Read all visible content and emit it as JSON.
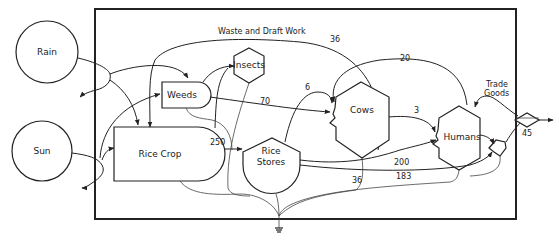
{
  "diagram": {
    "type": "energy-systems-flow-diagram",
    "sources": [
      {
        "id": "rain",
        "label": "Rain",
        "icon": "circle-source-icon"
      },
      {
        "id": "sun",
        "label": "Sun",
        "icon": "circle-source-icon"
      }
    ],
    "nodes": [
      {
        "id": "weeds",
        "label": "Weeds",
        "shape": "producer"
      },
      {
        "id": "insects",
        "label": "Insects",
        "shape": "consumer-hexagon"
      },
      {
        "id": "rice_crop",
        "label": "Rice Crop",
        "shape": "producer"
      },
      {
        "id": "rice_stores_line1",
        "label": "Rice"
      },
      {
        "id": "rice_stores_line2",
        "label": "Stores"
      },
      {
        "id": "cows",
        "label": "Cows",
        "shape": "consumer-hexagon"
      },
      {
        "id": "humans",
        "label": "Humans",
        "shape": "consumer-hexagon"
      }
    ],
    "annotations": {
      "waste_draft_work": "Waste and Draft Work",
      "trade_goods_line1": "Trade",
      "trade_goods_line2": "Goods"
    },
    "flows": [
      {
        "from": "cows",
        "to": "rice_crop",
        "label": "36",
        "note": "waste and draft work"
      },
      {
        "from": "humans",
        "to": "cows",
        "label": "20"
      },
      {
        "from": "rice_stores",
        "to": "cows",
        "label": "6"
      },
      {
        "from": "weeds",
        "to": "cows",
        "label": "70"
      },
      {
        "from": "cows",
        "to": "humans",
        "label": "3"
      },
      {
        "from": "rice_crop",
        "to": "rice_stores",
        "label": "250"
      },
      {
        "from": "rice_stores",
        "to": "humans",
        "label": "200"
      },
      {
        "from": "cows",
        "to": "heat_sink",
        "label": "36"
      },
      {
        "from": "humans",
        "to": "heat_sink",
        "label": "183"
      },
      {
        "from": "trade",
        "to": "outside",
        "label": "45"
      }
    ],
    "colors": {
      "line": "#222222",
      "background": "#ffffff"
    }
  }
}
